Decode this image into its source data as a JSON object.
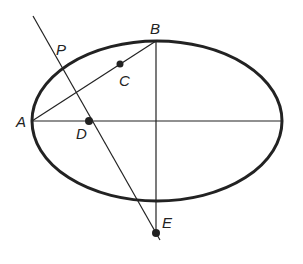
{
  "diagram": {
    "type": "geometry-construction",
    "ellipse": {
      "cx": 157,
      "cy": 121,
      "rx": 125,
      "ry": 80,
      "stroke": "#222222",
      "stroke_width": 3
    },
    "points": {
      "A": {
        "label": "A",
        "x": 32,
        "y": 121
      },
      "B": {
        "label": "B",
        "x": 156,
        "y": 41
      },
      "C": {
        "label": "C",
        "x": 120,
        "y": 64
      },
      "D": {
        "label": "D",
        "x": 89,
        "y": 121
      },
      "E": {
        "label": "E",
        "x": 156,
        "y": 233
      },
      "P": {
        "label": "P",
        "x": 59,
        "y": 65
      }
    },
    "segments": [
      {
        "name": "major-axis",
        "from": "A",
        "to": "right-vertex"
      },
      {
        "name": "minor-axis-extended",
        "from": "B",
        "to": "E"
      },
      {
        "name": "chord-AB",
        "from": "A",
        "to": "B"
      },
      {
        "name": "line-PDE",
        "through": [
          "P",
          "D",
          "E"
        ]
      }
    ],
    "filled_points": [
      "C",
      "D",
      "E"
    ],
    "line_color": "#222222"
  }
}
